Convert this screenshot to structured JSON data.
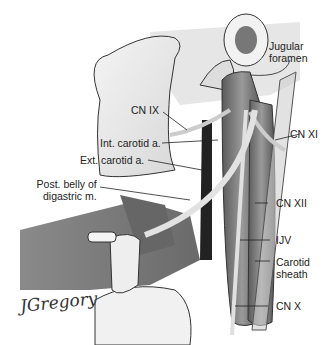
{
  "figure": {
    "signature": "JGregory",
    "labels": [
      {
        "id": "jugular-foramen",
        "text_lines": [
          "Jugular",
          "foramen"
        ]
      },
      {
        "id": "cn-ix",
        "text": "CN IX"
      },
      {
        "id": "cn-xi",
        "text": "CN XI"
      },
      {
        "id": "int-carotid",
        "text": "Int. carotid a."
      },
      {
        "id": "ext-carotid",
        "text": "Ext. carotid a."
      },
      {
        "id": "post-belly-digastric",
        "text_lines": [
          "Post. belly of",
          "digastric m."
        ]
      },
      {
        "id": "cn-xii",
        "text": "CN XII"
      },
      {
        "id": "ijv",
        "text": "IJV"
      },
      {
        "id": "carotid-sheath",
        "text_lines": [
          "Carotid",
          "sheath"
        ]
      },
      {
        "id": "cn-x",
        "text": "CN X"
      }
    ]
  }
}
